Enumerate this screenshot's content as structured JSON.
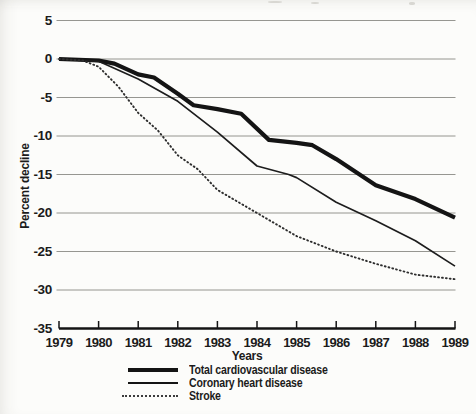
{
  "y_axis": {
    "title": "Percent decline",
    "tick_labels": [
      "5",
      "0",
      "-5",
      "-10",
      "-15",
      "-20",
      "-25",
      "-30",
      "-35"
    ]
  },
  "x_axis": {
    "title": "Years",
    "tick_labels": [
      "1979",
      "1980",
      "1981",
      "1982",
      "1983",
      "1984",
      "1985",
      "1986",
      "1987",
      "1988",
      "1989"
    ]
  },
  "chart_data": {
    "type": "line",
    "title": "",
    "xlabel": "Years",
    "ylabel": "Percent decline",
    "xlim": [
      1979,
      1989
    ],
    "ylim": [
      -35,
      5
    ],
    "x_ticks": [
      1979,
      1980,
      1981,
      1982,
      1983,
      1984,
      1985,
      1986,
      1987,
      1988,
      1989
    ],
    "y_ticks": [
      5,
      0,
      -5,
      -10,
      -15,
      -20,
      -25,
      -30,
      -35
    ],
    "grid": "horizontal-gridlines",
    "legend_position": "bottom-center",
    "colors": {
      "line": "#151515",
      "grid": "#8a8a85",
      "background": "#fcfcfa",
      "text": "#1b1b1b"
    },
    "series": [
      {
        "name": "Total cardiovascular disease",
        "line_style": "thick-solid",
        "years": [
          1979,
          1980,
          1981,
          1982,
          1983,
          1984,
          1985,
          1986,
          1987,
          1988,
          1989
        ],
        "values": [
          0,
          -0.2,
          -2,
          -4.5,
          -6.5,
          -9.5,
          -11,
          -13,
          -16.5,
          -18,
          -20.5
        ],
        "draw_points": [
          [
            1979,
            0
          ],
          [
            1980,
            -0.2
          ],
          [
            1980.4,
            -0.6
          ],
          [
            1981,
            -2
          ],
          [
            1981.4,
            -2.4
          ],
          [
            1982,
            -4.5
          ],
          [
            1982.4,
            -6
          ],
          [
            1983,
            -6.5
          ],
          [
            1983.6,
            -7.1
          ],
          [
            1984.3,
            -10.5
          ],
          [
            1985,
            -10.9
          ],
          [
            1985.4,
            -11.2
          ],
          [
            1986,
            -13
          ],
          [
            1987,
            -16.4
          ],
          [
            1988,
            -18.2
          ],
          [
            1989,
            -20.6
          ]
        ]
      },
      {
        "name": "Coronary heart disease",
        "line_style": "thin-solid",
        "years": [
          1979,
          1980,
          1981,
          1982,
          1983,
          1984,
          1985,
          1986,
          1987,
          1988,
          1989
        ],
        "values": [
          0,
          -0.3,
          -2.5,
          -5.5,
          -9.5,
          -14,
          -15.5,
          -18.5,
          -21,
          -23.5,
          -27
        ],
        "draw_points": [
          [
            1979,
            0
          ],
          [
            1980,
            -0.3
          ],
          [
            1981,
            -2.6
          ],
          [
            1982,
            -5.5
          ],
          [
            1983,
            -9.5
          ],
          [
            1984,
            -13.9
          ],
          [
            1984.8,
            -15
          ],
          [
            1985,
            -15.4
          ],
          [
            1986,
            -18.6
          ],
          [
            1987,
            -21
          ],
          [
            1988,
            -23.6
          ],
          [
            1989,
            -26.9
          ]
        ]
      },
      {
        "name": "Stroke",
        "line_style": "dotted",
        "years": [
          1979,
          1980,
          1981,
          1982,
          1983,
          1984,
          1985,
          1986,
          1987,
          1988,
          1989
        ],
        "values": [
          0,
          -1,
          -7,
          -12.5,
          -17,
          -20,
          -23,
          -25,
          -26.5,
          -28,
          -28.5
        ],
        "draw_points": [
          [
            1979,
            0
          ],
          [
            1979.6,
            -0.2
          ],
          [
            1980,
            -1
          ],
          [
            1980.5,
            -3.6
          ],
          [
            1981,
            -7
          ],
          [
            1981.5,
            -9.3
          ],
          [
            1982,
            -12.5
          ],
          [
            1982.5,
            -14.3
          ],
          [
            1983,
            -17
          ],
          [
            1984,
            -20
          ],
          [
            1985,
            -23
          ],
          [
            1986,
            -25
          ],
          [
            1987,
            -26.6
          ],
          [
            1988,
            -28
          ],
          [
            1989,
            -28.6
          ]
        ]
      }
    ]
  }
}
